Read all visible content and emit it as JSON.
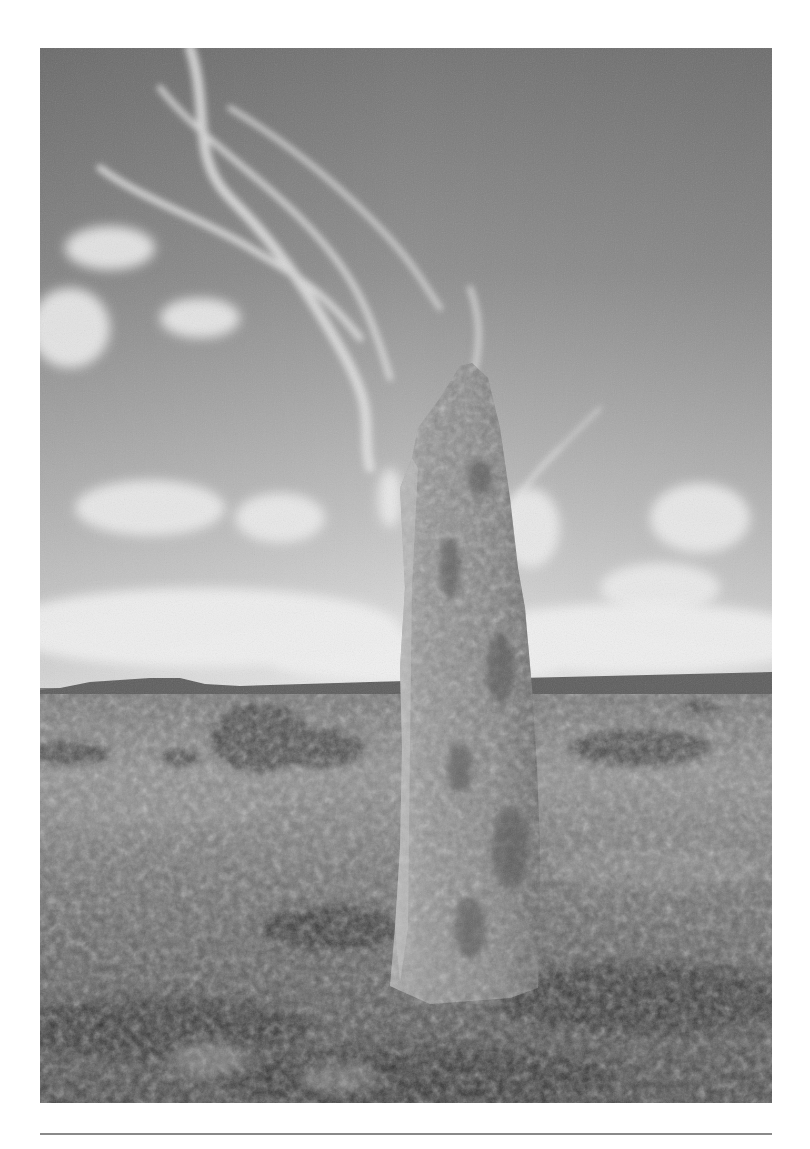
{
  "figure": {
    "style": "black-and-white photograph",
    "elements": [
      "cirrus clouds sky",
      "standing stone menhir",
      "moorland grass",
      "distant tor on horizon",
      "gorse bushes"
    ]
  },
  "colors": {
    "page_background": "#ffffff",
    "sky_top": "#7a7a7a",
    "sky_horizon": "#e6e6e6",
    "stone": "#8c8c8c",
    "ground": "#5a5a5a",
    "rule": "#8a8a8a"
  }
}
